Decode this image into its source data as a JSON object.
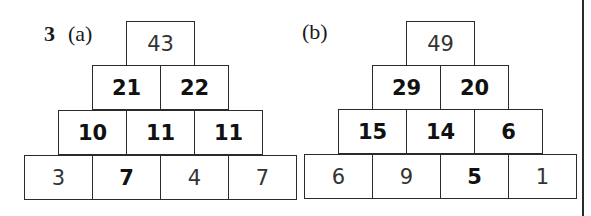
{
  "question": {
    "number": "3",
    "parts": [
      {
        "label": "(a)",
        "rows": [
          [
            {
              "value": "43",
              "style": "given"
            }
          ],
          [
            {
              "value": "21",
              "style": "answer"
            },
            {
              "value": "22",
              "style": "answer"
            }
          ],
          [
            {
              "value": "10",
              "style": "answer"
            },
            {
              "value": "11",
              "style": "answer"
            },
            {
              "value": "11",
              "style": "answer"
            }
          ],
          [
            {
              "value": "3",
              "style": "given"
            },
            {
              "value": "7",
              "style": "answer"
            },
            {
              "value": "4",
              "style": "given"
            },
            {
              "value": "7",
              "style": "given"
            }
          ]
        ]
      },
      {
        "label": "(b)",
        "rows": [
          [
            {
              "value": "49",
              "style": "given"
            }
          ],
          [
            {
              "value": "29",
              "style": "answer"
            },
            {
              "value": "20",
              "style": "answer"
            }
          ],
          [
            {
              "value": "15",
              "style": "answer"
            },
            {
              "value": "14",
              "style": "answer"
            },
            {
              "value": "6",
              "style": "answer"
            }
          ],
          [
            {
              "value": "6",
              "style": "given"
            },
            {
              "value": "9",
              "style": "given"
            },
            {
              "value": "5",
              "style": "answer"
            },
            {
              "value": "1",
              "style": "given"
            }
          ]
        ]
      }
    ]
  }
}
